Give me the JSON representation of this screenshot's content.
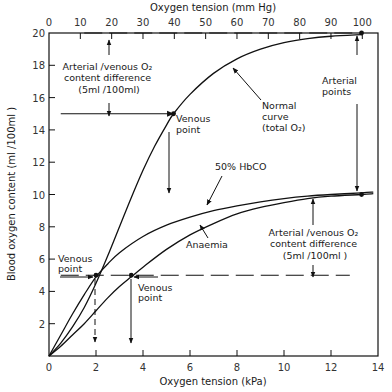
{
  "chart_data": {
    "type": "line",
    "title": "",
    "xlabel": "Oxygen tension (kPa)",
    "xlabel_top": "Oxygen tension (mm Hg)",
    "ylabel": "Blood oxygen content (ml /100ml )",
    "xlim": [
      0,
      14
    ],
    "xlim_top": [
      0,
      105
    ],
    "ylim": [
      0,
      20
    ],
    "x_ticks": [
      0,
      2,
      4,
      6,
      8,
      10,
      12,
      14
    ],
    "x_ticks_top": [
      0,
      10,
      20,
      30,
      40,
      50,
      60,
      70,
      80,
      90,
      100
    ],
    "y_ticks": [
      2,
      4,
      6,
      8,
      10,
      12,
      14,
      16,
      18,
      20
    ],
    "y_tick_labels_shown": [
      "2",
      "4",
      "6",
      "8",
      "10",
      "12",
      "14",
      "16",
      "18",
      "20"
    ],
    "grid": false,
    "series": [
      {
        "name": "Normal curve (total O2)",
        "x": [
          0,
          0.5,
          1,
          1.5,
          2,
          2.5,
          3,
          3.5,
          4,
          4.5,
          5,
          5.3,
          6,
          7,
          8,
          9,
          10,
          11,
          12,
          13.3
        ],
        "y": [
          0,
          0.8,
          1.8,
          3.0,
          4.5,
          6.2,
          8.0,
          9.8,
          11.5,
          13.0,
          14.3,
          15.0,
          16.2,
          17.5,
          18.4,
          19.0,
          19.4,
          19.65,
          19.8,
          19.9
        ]
      },
      {
        "name": "50% HbCO",
        "x": [
          0,
          0.5,
          1,
          1.5,
          2,
          2.5,
          3,
          4,
          5,
          6,
          7,
          8,
          9,
          10,
          11,
          12,
          13.3,
          13.8
        ],
        "y": [
          0,
          1.3,
          2.6,
          3.8,
          4.9,
          5.7,
          6.4,
          7.4,
          8.1,
          8.6,
          9.0,
          9.3,
          9.55,
          9.75,
          9.9,
          10.0,
          10.1,
          10.15
        ]
      },
      {
        "name": "Anaemia",
        "x": [
          0,
          0.5,
          1,
          1.5,
          2,
          2.5,
          3,
          3.5,
          4,
          5,
          6,
          7,
          8,
          9,
          10,
          11,
          12,
          13.3,
          13.8
        ],
        "y": [
          0,
          0.6,
          1.3,
          2.0,
          2.8,
          3.6,
          4.3,
          4.9,
          5.5,
          6.6,
          7.5,
          8.2,
          8.8,
          9.2,
          9.5,
          9.75,
          9.9,
          10.0,
          10.05
        ]
      }
    ],
    "points": [
      {
        "name": "Arterial point (normal)",
        "x": 13.3,
        "y": 20
      },
      {
        "name": "Venous point (normal)",
        "x": 5.3,
        "y": 15
      },
      {
        "name": "Arterial point (reduced capacity)",
        "x": 13.3,
        "y": 10
      },
      {
        "name": "Venous point (50% HbCO)",
        "x": 2.0,
        "y": 5
      },
      {
        "name": "Venous point (Anaemia)",
        "x": 3.5,
        "y": 5
      }
    ],
    "reference_lines": [
      {
        "name": "arterial-level-normal",
        "y": 20,
        "x_from": 1.5,
        "x_to": 13.3,
        "style": "dashed"
      },
      {
        "name": "venous-level-normal",
        "y": 15,
        "x_from": 0.5,
        "x_to": 5.3,
        "style": "solid"
      },
      {
        "name": "venous-level-reduced",
        "y": 5,
        "x_from": 0.5,
        "x_to": 12.8,
        "style": "dashed"
      }
    ],
    "annotations": [
      {
        "id": "avd_top",
        "lines": [
          "Arterial /venous O₂",
          "content difference",
          "(5ml /100ml)"
        ]
      },
      {
        "id": "venous_normal",
        "lines": [
          "Venous",
          "point"
        ]
      },
      {
        "id": "normal_curve",
        "lines": [
          "Normal",
          "curve",
          "(total O₂)"
        ]
      },
      {
        "id": "arterial_points",
        "lines": [
          "Arterial",
          "points"
        ]
      },
      {
        "id": "hbco",
        "lines": [
          "50% HbCO"
        ]
      },
      {
        "id": "anaemia",
        "lines": [
          "Anaemia"
        ]
      },
      {
        "id": "avd_bottom",
        "lines": [
          "Arterial /venous O₂",
          "content difference",
          "(5ml /100ml )"
        ]
      },
      {
        "id": "venous_hbco",
        "lines": [
          "Venous",
          "point"
        ]
      },
      {
        "id": "venous_anaemia",
        "lines": [
          "Venous",
          "point"
        ]
      }
    ],
    "legend": "none"
  }
}
